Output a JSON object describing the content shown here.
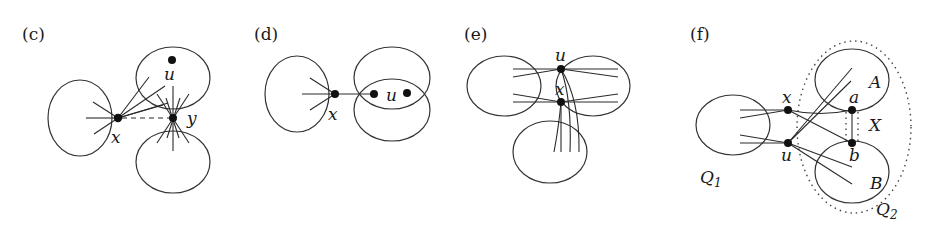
{
  "figure": {
    "panels": [
      {
        "id": "c",
        "label": "(c)",
        "vertices": {
          "x": "x",
          "y": "y",
          "u": "u"
        }
      },
      {
        "id": "d",
        "label": "(d)",
        "vertices": {
          "x": "x",
          "u": "u"
        }
      },
      {
        "id": "e",
        "label": "(e)",
        "vertices": {
          "u": "u",
          "x": "x"
        }
      },
      {
        "id": "f",
        "label": "(f)",
        "vertices": {
          "x": "x",
          "u": "u",
          "a": "a",
          "b": "b"
        },
        "sets": {
          "A": "A",
          "B": "B",
          "X": "X",
          "Q1_main": "Q",
          "Q1_sub": "1",
          "Q2_main": "Q",
          "Q2_sub": "2"
        }
      }
    ],
    "colors": {
      "stroke": "#333333",
      "vertex": "#111111",
      "background": "#ffffff"
    }
  }
}
